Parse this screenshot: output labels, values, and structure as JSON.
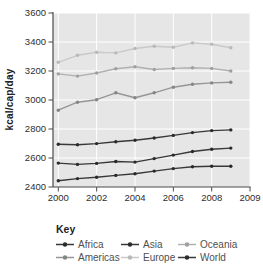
{
  "figure": {
    "key_label": "Key",
    "ylabel": "kcal/cap/day"
  },
  "chart_data": {
    "type": "line",
    "title": "",
    "xlabel": "",
    "ylabel": "kcal/cap/day",
    "x": [
      2000,
      2001,
      2002,
      2003,
      2004,
      2005,
      2006,
      2007,
      2008,
      2009
    ],
    "x_tick_labels": [
      "2000",
      "2002",
      "2004",
      "2006",
      "2008",
      "2009"
    ],
    "y_ticks": [
      2400,
      2600,
      2800,
      3000,
      3200,
      3400,
      3600
    ],
    "ylim": [
      2400,
      3600
    ],
    "grid": true,
    "legend_position": "bottom",
    "plot_bg_color": "#e6e6e6",
    "grid_color": "#ffffff",
    "axis_color": "#4a4a4a",
    "tick_text_color": "#2e2e2e",
    "series": [
      {
        "name": "Africa",
        "color": "#383838",
        "marker_color": "#2a2a2a",
        "values": [
          2443,
          2458,
          2467,
          2480,
          2492,
          2510,
          2527,
          2540,
          2543,
          2543
        ]
      },
      {
        "name": "Americas",
        "color": "#969696",
        "marker_color": "#858585",
        "values": [
          2930,
          2985,
          3002,
          3050,
          3015,
          3050,
          3088,
          3108,
          3118,
          3123
        ]
      },
      {
        "name": "Asia",
        "color": "#383838",
        "marker_color": "#2a2a2a",
        "values": [
          2565,
          2556,
          2563,
          2576,
          2572,
          2596,
          2620,
          2645,
          2660,
          2668
        ]
      },
      {
        "name": "Europe",
        "color": "#c9c9c9",
        "marker_color": "#b9b9b9",
        "values": [
          3260,
          3308,
          3330,
          3325,
          3355,
          3370,
          3364,
          3394,
          3385,
          3360
        ]
      },
      {
        "name": "Oceania",
        "color": "#b0b0b0",
        "marker_color": "#9f9f9f",
        "values": [
          3180,
          3165,
          3186,
          3216,
          3230,
          3210,
          3218,
          3223,
          3218,
          3200
        ]
      },
      {
        "name": "World",
        "color": "#383838",
        "marker_color": "#2a2a2a",
        "values": [
          2695,
          2691,
          2699,
          2712,
          2723,
          2738,
          2756,
          2775,
          2789,
          2794
        ]
      }
    ]
  }
}
